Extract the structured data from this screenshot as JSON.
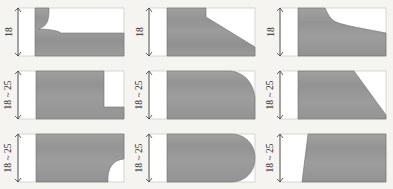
{
  "drawing": {
    "title": "Worktop edge profile cross-sections",
    "background_color": "#f6f4f0",
    "material_fill_color": "#9a9a9a",
    "material_stroke_color": "#6f6f6f",
    "panel_border_color": "#c9c6c0",
    "dimension_line_color": "#3a3a3a",
    "rows": 3,
    "columns": 3
  },
  "panels": [
    {
      "id": "panel-1",
      "row": 1,
      "column": 1,
      "dimension_label": "18",
      "profile_name": "cove-with-lip",
      "description": "Thick left body with concave cove cut, thin lip extending right"
    },
    {
      "id": "panel-2",
      "row": 1,
      "column": 2,
      "dimension_label": "18",
      "profile_name": "stepped-long-bevel",
      "description": "Square step at top then long straight bevel down to right"
    },
    {
      "id": "panel-3",
      "row": 1,
      "column": 3,
      "dimension_label": "18",
      "profile_name": "ogee-sweep",
      "description": "S-curve ogee sweeping out to a thin right edge"
    },
    {
      "id": "panel-4",
      "row": 2,
      "column": 1,
      "dimension_label": "18 ~ 25",
      "profile_name": "rabbet-step",
      "description": "Rectangular rebate notch cut from bottom right corner"
    },
    {
      "id": "panel-5",
      "row": 2,
      "column": 2,
      "dimension_label": "18 ~ 25",
      "profile_name": "rounded-corner",
      "description": "Large radius rounded right edge, square bottom"
    },
    {
      "id": "panel-6",
      "row": 2,
      "column": 3,
      "dimension_label": "18 ~ 25",
      "profile_name": "large-chamfer",
      "description": "Large straight chamfer from top right down to bottom right"
    },
    {
      "id": "panel-7",
      "row": 3,
      "column": 1,
      "dimension_label": "18 ~ 25",
      "profile_name": "cove-notch",
      "description": "Small concave cove notch at bottom right corner"
    },
    {
      "id": "panel-8",
      "row": 3,
      "column": 2,
      "dimension_label": "18 ~ 25",
      "profile_name": "full-bullnose",
      "description": "Full semicircular bullnose right edge"
    },
    {
      "id": "panel-9",
      "row": 3,
      "column": 3,
      "dimension_label": "18 ~ 25",
      "profile_name": "angled-left-square-right",
      "description": "Slanted left leading edge with plain square right end"
    }
  ]
}
